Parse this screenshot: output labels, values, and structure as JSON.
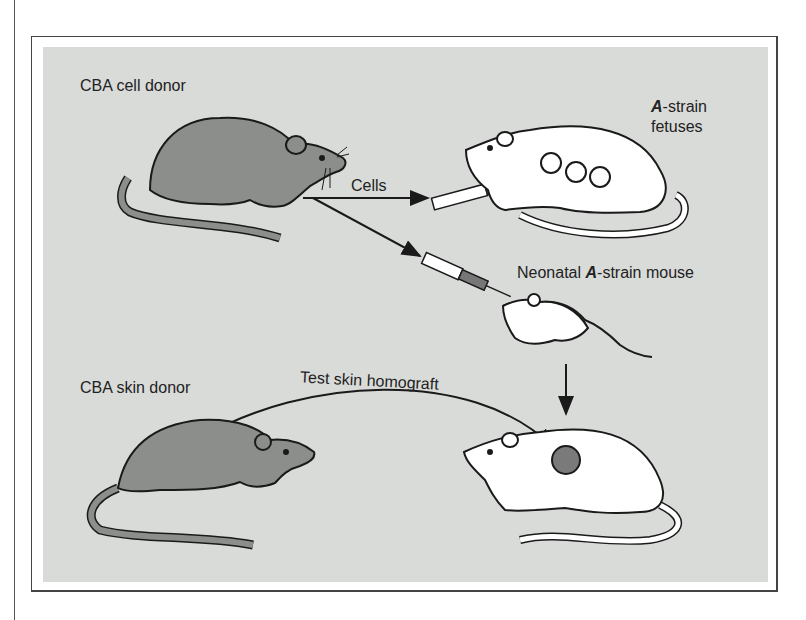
{
  "figure": {
    "labels": {
      "cba_cell_donor": "CBA cell donor",
      "cells": "Cells",
      "a_strain_prefix": "A",
      "a_strain_suffix": "-strain",
      "fetuses": "fetuses",
      "neonatal_prefix": "Neonatal ",
      "neonatal_a": "A",
      "neonatal_suffix": "-strain mouse",
      "cba_skin_donor": "CBA skin donor",
      "test_skin_homograft": "Test skin homograft"
    },
    "colors": {
      "panel_background": "#d9dbd9",
      "cba_mouse_fill": "#8c8e8c",
      "a_strain_mouse_fill": "#ffffff",
      "graft_patch": "#7a7a7a",
      "outline": "#1a1a1a"
    }
  }
}
